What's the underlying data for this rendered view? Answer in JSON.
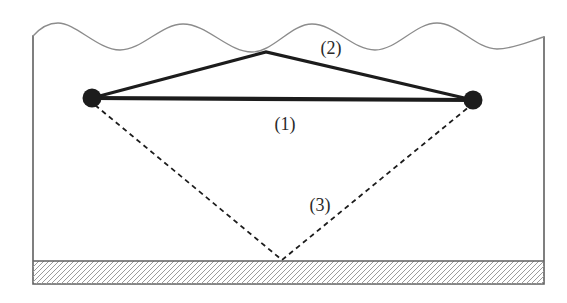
{
  "figure": {
    "labels": {
      "direct": "(1)",
      "surface": "(2)",
      "bottom": "(3)"
    },
    "colors": {
      "ink": "#1c1c1c",
      "frame": "#606060",
      "wave": "#8c8c8c",
      "hatch_line": "#9c9c9c",
      "label_ink": "#2a2a2a",
      "background": "#ffffff"
    }
  }
}
